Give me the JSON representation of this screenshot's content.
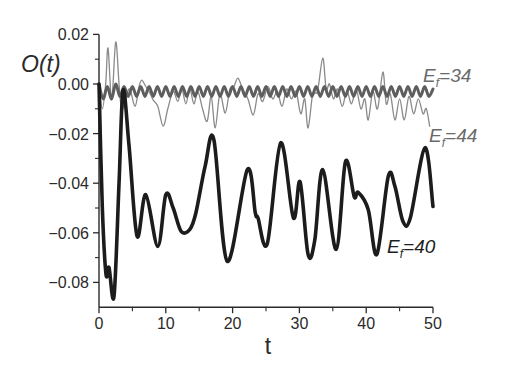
{
  "chart_data": {
    "type": "line",
    "title": "",
    "xlabel": "t",
    "ylabel": "O(t)",
    "xlim": [
      0,
      50
    ],
    "ylim": [
      -0.09,
      0.02
    ],
    "grid": false,
    "legend": "inline labels at right end of curves",
    "xticks": [
      0,
      10,
      20,
      30,
      40,
      50
    ],
    "xtick_labels": [
      "0",
      "10",
      "20",
      "30",
      "40",
      "50"
    ],
    "xminor": [
      5,
      15,
      25,
      35,
      45
    ],
    "yticks": [
      0.02,
      0.0,
      -0.02,
      -0.04,
      -0.06,
      -0.08
    ],
    "ytick_labels": [
      "0.02",
      "0.00",
      "−0.02",
      "−0.04",
      "−0.06",
      "−0.08"
    ],
    "yminor": [
      0.01,
      -0.01,
      -0.03,
      -0.05,
      -0.07
    ],
    "series": [
      {
        "name": "E_f = 44",
        "label_parts": {
          "E": "E",
          "sub": "f",
          "rest": "=44"
        },
        "color": "#8a8a8a",
        "width": 1.3,
        "t": [
          0,
          0.5,
          1.0,
          1.35,
          1.9,
          2.5,
          3.0,
          3.4,
          4.0,
          4.6,
          5.4,
          6.0,
          6.4,
          7.0,
          7.5,
          8.1,
          8.8,
          9.6,
          10.3,
          11.1,
          11.8,
          12.4,
          13.0,
          13.6,
          14.2,
          14.8,
          15.5,
          16.2,
          16.8,
          17.4,
          18.1,
          18.9,
          19.6,
          20.2,
          20.8,
          21.5,
          22.3,
          23.1,
          23.8,
          24.5,
          25.3,
          26.0,
          26.7,
          27.4,
          28.1,
          28.8,
          29.5,
          30.2,
          30.8,
          31.3,
          32.0,
          32.7,
          33.5,
          34.0,
          34.5,
          35.1,
          35.7,
          36.4,
          37.1,
          37.8,
          38.5,
          39.2,
          39.8,
          40.3,
          41.0,
          41.7,
          42.5,
          43.0,
          43.6,
          44.3,
          45.0,
          45.7,
          46.4,
          47.1,
          47.8,
          48.5,
          49.0,
          49.5
        ],
        "values": [
          0,
          -0.01,
          0.0,
          0.0145,
          -0.0064,
          0.0169,
          0.0,
          -0.0104,
          -0.006,
          -0.002,
          -0.009,
          -0.001,
          0.0016,
          -0.001,
          -0.003,
          -0.0064,
          -0.009,
          -0.017,
          -0.01,
          -0.003,
          -0.007,
          -0.002,
          -0.008,
          -0.002,
          -0.008,
          -0.003,
          -0.01,
          -0.015,
          -0.005,
          -0.0177,
          -0.004,
          -0.0117,
          -0.002,
          -0.001,
          0.0024,
          -0.002,
          -0.006,
          -0.0125,
          -0.004,
          -0.007,
          -0.001,
          -0.006,
          -0.003,
          -0.009,
          -0.002,
          -0.006,
          -0.003,
          -0.012,
          -0.006,
          -0.0177,
          -0.004,
          -0.003,
          0.0104,
          -0.002,
          0.0,
          -0.006,
          -0.002,
          -0.009,
          -0.003,
          -0.008,
          -0.002,
          -0.01,
          -0.006,
          -0.0145,
          -0.003,
          -0.01,
          0.0048,
          -0.008,
          -0.004,
          -0.0145,
          -0.006,
          -0.0145,
          -0.005,
          -0.012,
          -0.006,
          -0.012,
          -0.01,
          -0.017
        ]
      },
      {
        "name": "E_f = 34",
        "label_parts": {
          "E": "E",
          "sub": "f",
          "rest": "=34"
        },
        "color": "#5e5e5e",
        "width": 3,
        "t": [
          0,
          0.625,
          1.25,
          1.875,
          2.5,
          3.125,
          3.75,
          4.375,
          5.0,
          5.625,
          6.25,
          6.875,
          7.5,
          8.125,
          8.75,
          9.375,
          10.0,
          10.625,
          11.25,
          11.875,
          12.5,
          13.125,
          13.75,
          14.375,
          15.0,
          15.625,
          16.25,
          16.875,
          17.5,
          18.125,
          18.75,
          19.375,
          20.0,
          20.625,
          21.25,
          21.875,
          22.5,
          23.125,
          23.75,
          24.375,
          25.0,
          25.625,
          26.25,
          26.875,
          27.5,
          28.125,
          28.75,
          29.375,
          30.0,
          30.625,
          31.25,
          31.875,
          32.5,
          33.125,
          33.75,
          34.375,
          35.0,
          35.625,
          36.25,
          36.875,
          37.5,
          38.125,
          38.75,
          39.375,
          40.0,
          40.625,
          41.25,
          41.875,
          42.5,
          43.125,
          43.75,
          44.375,
          45.0,
          45.625,
          46.25,
          46.875,
          47.5,
          48.125,
          48.75,
          49.375,
          50.0
        ],
        "values": [
          0.0,
          -0.006,
          -0.001,
          -0.006,
          0.0,
          -0.005,
          -0.001,
          -0.005,
          -0.001,
          -0.005,
          -0.001,
          -0.005,
          -0.001,
          -0.005,
          -0.001,
          -0.005,
          -0.001,
          -0.005,
          -0.001,
          -0.005,
          -0.001,
          -0.005,
          -0.001,
          -0.005,
          -0.001,
          -0.005,
          -0.001,
          -0.005,
          -0.001,
          -0.005,
          -0.001,
          -0.005,
          -0.001,
          -0.005,
          -0.001,
          -0.005,
          -0.001,
          -0.005,
          -0.001,
          -0.005,
          -0.001,
          -0.005,
          -0.001,
          -0.005,
          -0.001,
          -0.005,
          -0.001,
          -0.005,
          -0.001,
          -0.005,
          -0.001,
          -0.005,
          -0.001,
          -0.005,
          -0.001,
          -0.005,
          -0.001,
          -0.005,
          -0.001,
          -0.005,
          -0.001,
          -0.005,
          -0.001,
          -0.005,
          -0.001,
          -0.005,
          -0.001,
          -0.005,
          -0.001,
          -0.005,
          -0.001,
          -0.005,
          -0.001,
          -0.005,
          -0.001,
          -0.005,
          -0.001,
          -0.005,
          -0.001,
          -0.005,
          -0.002
        ]
      },
      {
        "name": "E_f = 40",
        "label_parts": {
          "E": "E",
          "sub": "f",
          "rest": "=40"
        },
        "color": "#1c1c1c",
        "width": 3.6,
        "t": [
          0,
          0.5,
          1.05,
          1.5,
          2.25,
          3.0,
          3.6,
          4.5,
          5.7,
          7.0,
          8.8,
          10.0,
          11.1,
          12.3,
          13.6,
          14.5,
          15.9,
          17.2,
          19.2,
          22.2,
          23.4,
          23.8,
          25.2,
          27.2,
          29.1,
          30.1,
          31.3,
          32.3,
          33.5,
          35.5,
          36.9,
          38.2,
          38.8,
          40.3,
          41.6,
          43.3,
          44.3,
          45.5,
          46.6,
          48.8,
          50.0
        ],
        "values": [
          0,
          -0.05,
          -0.0767,
          -0.074,
          -0.0855,
          -0.04,
          -0.0025,
          -0.025,
          -0.0614,
          -0.0446,
          -0.0655,
          -0.0446,
          -0.05,
          -0.0594,
          -0.0586,
          -0.052,
          -0.033,
          -0.0225,
          -0.0715,
          -0.0345,
          -0.052,
          -0.054,
          -0.0643,
          -0.0237,
          -0.054,
          -0.0394,
          -0.0687,
          -0.063,
          -0.0345,
          -0.0667,
          -0.0313,
          -0.0454,
          -0.0437,
          -0.0506,
          -0.0687,
          -0.0373,
          -0.0413,
          -0.0554,
          -0.054,
          -0.0257,
          -0.0494
        ]
      }
    ]
  },
  "labels": {
    "ylabel": "O(t)",
    "xlabel": "t",
    "e34": {
      "E": "E",
      "sub": "f",
      "rest": "=34"
    },
    "e44": {
      "E": "E",
      "sub": "f",
      "rest": "=44"
    },
    "e40": {
      "E": "E",
      "sub": "f",
      "rest": "=40"
    }
  },
  "colors": {
    "axis": "#2a2a2a",
    "label_gray": "#6a6a6a",
    "label_dark": "#1e1e1e"
  }
}
